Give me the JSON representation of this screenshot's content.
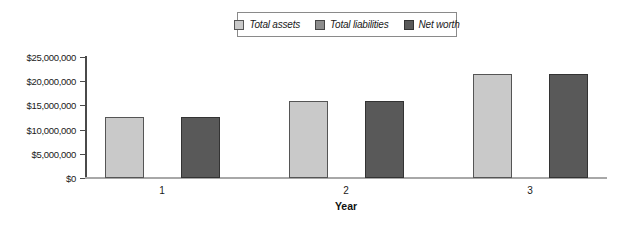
{
  "legend": {
    "items": [
      {
        "label": "Total assets",
        "fill": "#c9c9c9",
        "border": "#555555"
      },
      {
        "label": "Total liabilities",
        "fill": "#8c8c8c",
        "border": "#444444"
      },
      {
        "label": "Net worth",
        "fill": "#595959",
        "border": "#333333"
      }
    ]
  },
  "chart_data": {
    "type": "bar",
    "categories": [
      "1",
      "2",
      "3"
    ],
    "series": [
      {
        "name": "Total assets",
        "values": [
          12500000,
          16000000,
          21500000
        ],
        "fill": "#c9c9c9",
        "border": "#555555"
      },
      {
        "name": "Total liabilities",
        "values": [
          0,
          0,
          0
        ],
        "fill": "#8c8c8c",
        "border": "#444444"
      },
      {
        "name": "Net worth",
        "values": [
          12500000,
          16000000,
          21500000
        ],
        "fill": "#595959",
        "border": "#333333"
      }
    ],
    "title": "",
    "xlabel": "Year",
    "ylabel": "",
    "ylim": [
      0,
      25000000
    ],
    "yticks": [
      {
        "value": 0,
        "label": "$0"
      },
      {
        "value": 5000000,
        "label": "$5,000,000"
      },
      {
        "value": 10000000,
        "label": "$10,000,000"
      },
      {
        "value": 15000000,
        "label": "$15,000,000"
      },
      {
        "value": 20000000,
        "label": "$20,000,000"
      },
      {
        "value": 25000000,
        "label": "$25,000,000"
      }
    ],
    "legend_position": "top",
    "grid": false,
    "colors": {
      "y_axis_line": "#4a4a4a",
      "x_axis_line": "#a8a8a8",
      "background": "#ffffff"
    }
  }
}
